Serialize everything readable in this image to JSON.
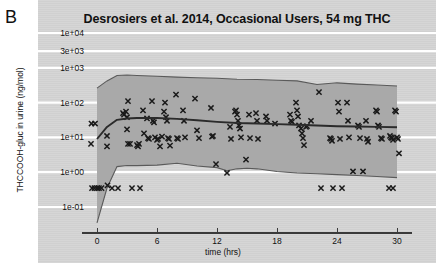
{
  "figure": {
    "panel_letter": "B",
    "background_color": "#d4d4d4",
    "band_color": "#a9a9a9",
    "gridline_color": "#ffffff",
    "line_color": "#2b2b2b",
    "marker_color": "#1a1a1a"
  },
  "chart_data": {
    "type": "scatter",
    "title": "Desrosiers et al. 2014, Occasional Users, 54 mg THC",
    "xlabel": "time (hrs)",
    "ylabel": "THCCOOH-gluc in urine (ng/mol)",
    "xlim": [
      -1.5,
      31.5
    ],
    "ylim": [
      0.03,
      10000
    ],
    "yscale": "log",
    "grid": true,
    "legend": null,
    "xticks": [
      0,
      6,
      12,
      18,
      24,
      30
    ],
    "xticklabels": [
      "0",
      "6",
      "12",
      "18",
      "24",
      "30"
    ],
    "yticks": [
      10000,
      3000,
      1000,
      100,
      10,
      1,
      0.1
    ],
    "yticklabels": [
      "1e+04",
      "3e+03",
      "1e+03",
      "1e+02",
      "1e+01",
      "1e+00",
      "1e-01"
    ],
    "series": [
      {
        "name": "median prediction",
        "type": "line",
        "x": [
          0,
          1,
          2,
          3,
          4,
          6,
          8,
          10,
          12,
          14,
          16,
          18,
          20,
          22,
          24,
          26,
          28,
          30
        ],
        "y": [
          9.0,
          20.0,
          32.0,
          35.0,
          36.0,
          36.0,
          34.0,
          31.0,
          28.0,
          26.0,
          25.0,
          24.0,
          23.0,
          22.0,
          21.0,
          20.5,
          20.0,
          19.5
        ]
      },
      {
        "name": "upper 95th percentile",
        "type": "line",
        "x": [
          0,
          1,
          2,
          3,
          4,
          6,
          8,
          10,
          12,
          14,
          16,
          18,
          20,
          22,
          24,
          26,
          28,
          30
        ],
        "y": [
          260,
          420,
          600,
          620,
          600,
          570,
          540,
          520,
          500,
          470,
          460,
          440,
          420,
          330,
          370,
          340,
          320,
          300
        ]
      },
      {
        "name": "lower 5th percentile",
        "type": "line",
        "x": [
          0,
          1,
          2,
          3,
          4,
          6,
          8,
          10,
          12,
          13,
          14,
          15,
          16,
          18,
          20,
          22,
          24,
          26,
          28,
          30
        ],
        "y": [
          0.035,
          0.35,
          1.45,
          1.55,
          1.55,
          1.6,
          1.8,
          1.5,
          1.35,
          1.1,
          1.25,
          1.3,
          1.25,
          1.05,
          0.95,
          0.9,
          0.85,
          0.8,
          0.75,
          0.7
        ]
      },
      {
        "name": "observed concentrations",
        "type": "scatter",
        "marker": "x",
        "points": [
          [
            -0.55,
            25
          ],
          [
            -0.2,
            25
          ],
          [
            -0.6,
            6.5
          ],
          [
            -0.5,
            0.35
          ],
          [
            -0.25,
            0.35
          ],
          [
            0.0,
            0.35
          ],
          [
            0.2,
            0.35
          ],
          [
            0.45,
            0.35
          ],
          [
            1.0,
            11
          ],
          [
            1.0,
            5.5
          ],
          [
            1.05,
            0.42
          ],
          [
            1.5,
            0.35
          ],
          [
            2.1,
            0.35
          ],
          [
            2.6,
            50
          ],
          [
            2.7,
            45
          ],
          [
            2.9,
            55
          ],
          [
            3.0,
            38
          ],
          [
            3.1,
            110
          ],
          [
            3.0,
            17
          ],
          [
            3.1,
            6.5
          ],
          [
            3.3,
            6.5
          ],
          [
            3.5,
            0.35
          ],
          [
            4.0,
            6.0
          ],
          [
            4.1,
            5.5
          ],
          [
            4.2,
            6.5
          ],
          [
            4.3,
            0.35
          ],
          [
            4.6,
            60
          ],
          [
            4.7,
            13
          ],
          [
            5.0,
            35
          ],
          [
            5.1,
            9.5
          ],
          [
            5.2,
            9.0
          ],
          [
            5.5,
            110
          ],
          [
            5.6,
            30
          ],
          [
            5.7,
            27
          ],
          [
            5.8,
            10
          ],
          [
            6.0,
            8.5
          ],
          [
            6.1,
            9.0
          ],
          [
            6.3,
            5.5
          ],
          [
            6.5,
            10.5
          ],
          [
            6.7,
            55
          ],
          [
            6.8,
            100
          ],
          [
            6.9,
            38
          ],
          [
            7.0,
            30
          ],
          [
            7.1,
            9.5
          ],
          [
            7.2,
            9.0
          ],
          [
            7.3,
            5.8
          ],
          [
            7.9,
            170
          ],
          [
            8.0,
            9.5
          ],
          [
            8.1,
            9.0
          ],
          [
            8.6,
            60
          ],
          [
            8.7,
            30
          ],
          [
            8.8,
            10
          ],
          [
            9.8,
            130
          ],
          [
            10.0,
            16
          ],
          [
            10.2,
            9.5
          ],
          [
            11.4,
            70
          ],
          [
            11.5,
            10.5
          ],
          [
            11.6,
            11
          ],
          [
            11.9,
            1.7
          ],
          [
            13.0,
            0.95
          ],
          [
            13.3,
            20
          ],
          [
            13.4,
            9.0
          ],
          [
            13.8,
            55
          ],
          [
            13.9,
            60
          ],
          [
            14.0,
            45
          ],
          [
            14.1,
            30
          ],
          [
            14.2,
            22
          ],
          [
            14.3,
            18
          ],
          [
            14.4,
            10
          ],
          [
            14.9,
            2.3
          ],
          [
            15.2,
            45
          ],
          [
            15.3,
            9.5
          ],
          [
            15.9,
            50
          ],
          [
            16.0,
            30
          ],
          [
            16.1,
            9.0
          ],
          [
            16.9,
            40
          ],
          [
            17.0,
            30
          ],
          [
            17.8,
            25
          ],
          [
            19.3,
            45
          ],
          [
            19.4,
            30
          ],
          [
            19.5,
            28
          ],
          [
            19.9,
            100
          ],
          [
            20.0,
            60
          ],
          [
            20.1,
            40
          ],
          [
            20.2,
            22
          ],
          [
            20.4,
            18
          ],
          [
            20.5,
            13
          ],
          [
            20.6,
            9.5
          ],
          [
            20.7,
            6.0
          ],
          [
            20.9,
            20
          ],
          [
            21.0,
            21
          ],
          [
            21.4,
            30
          ],
          [
            22.2,
            200
          ],
          [
            22.4,
            0.35
          ],
          [
            23.3,
            9.5
          ],
          [
            23.4,
            9.0
          ],
          [
            23.5,
            8.0
          ],
          [
            23.6,
            0.35
          ],
          [
            24.1,
            100
          ],
          [
            24.2,
            55
          ],
          [
            24.3,
            9.0
          ],
          [
            24.5,
            0.35
          ],
          [
            25.0,
            100
          ],
          [
            25.1,
            30
          ],
          [
            25.2,
            10
          ],
          [
            25.6,
            1.05
          ],
          [
            26.1,
            22
          ],
          [
            26.2,
            20
          ],
          [
            26.3,
            9.5
          ],
          [
            26.6,
            1.05
          ],
          [
            26.9,
            30
          ],
          [
            27.0,
            9.0
          ],
          [
            27.1,
            7.5
          ],
          [
            27.9,
            60
          ],
          [
            28.0,
            55
          ],
          [
            28.1,
            22
          ],
          [
            28.2,
            20
          ],
          [
            28.4,
            9.5
          ],
          [
            28.5,
            9.0
          ],
          [
            29.2,
            0.35
          ],
          [
            29.6,
            0.35
          ],
          [
            29.3,
            11
          ],
          [
            29.4,
            10
          ],
          [
            29.5,
            9.5
          ],
          [
            29.6,
            8.5
          ],
          [
            29.8,
            60
          ],
          [
            29.9,
            55
          ],
          [
            30.0,
            10
          ],
          [
            30.1,
            9.0
          ],
          [
            30.2,
            3.5
          ]
        ]
      }
    ]
  }
}
